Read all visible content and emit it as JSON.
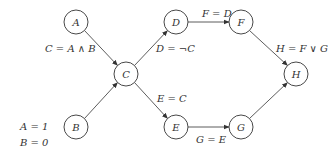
{
  "nodes": [
    {
      "id": "A",
      "label": "A",
      "x": 76,
      "y": 22
    },
    {
      "id": "B",
      "label": "B",
      "x": 76,
      "y": 127
    },
    {
      "id": "C",
      "label": "C",
      "x": 126,
      "y": 74
    },
    {
      "id": "D",
      "label": "D",
      "x": 176,
      "y": 22
    },
    {
      "id": "E",
      "label": "E",
      "x": 176,
      "y": 127
    },
    {
      "id": "F",
      "label": "F",
      "x": 241,
      "y": 22
    },
    {
      "id": "G",
      "label": "G",
      "x": 241,
      "y": 127
    },
    {
      "id": "H",
      "label": "H",
      "x": 296,
      "y": 74
    }
  ],
  "edges": [
    {
      "from": "A",
      "to": "C"
    },
    {
      "from": "B",
      "to": "C"
    },
    {
      "from": "C",
      "to": "D"
    },
    {
      "from": "C",
      "to": "E"
    },
    {
      "from": "D",
      "to": "F"
    },
    {
      "from": "E",
      "to": "G"
    },
    {
      "from": "F",
      "to": "H"
    },
    {
      "from": "G",
      "to": "H"
    }
  ],
  "edge_labels": {
    "c_eq": "C = A ∧ B",
    "d_eq": "D = ¬C",
    "e_eq": "E = C",
    "f_eq": "F = D",
    "g_eq": "G = E",
    "h_eq": "H = F ∨ G"
  },
  "inputs": {
    "a_val": "A = 1",
    "b_val": "B = 0"
  },
  "node_radius": 12,
  "stroke_color": "#333333"
}
